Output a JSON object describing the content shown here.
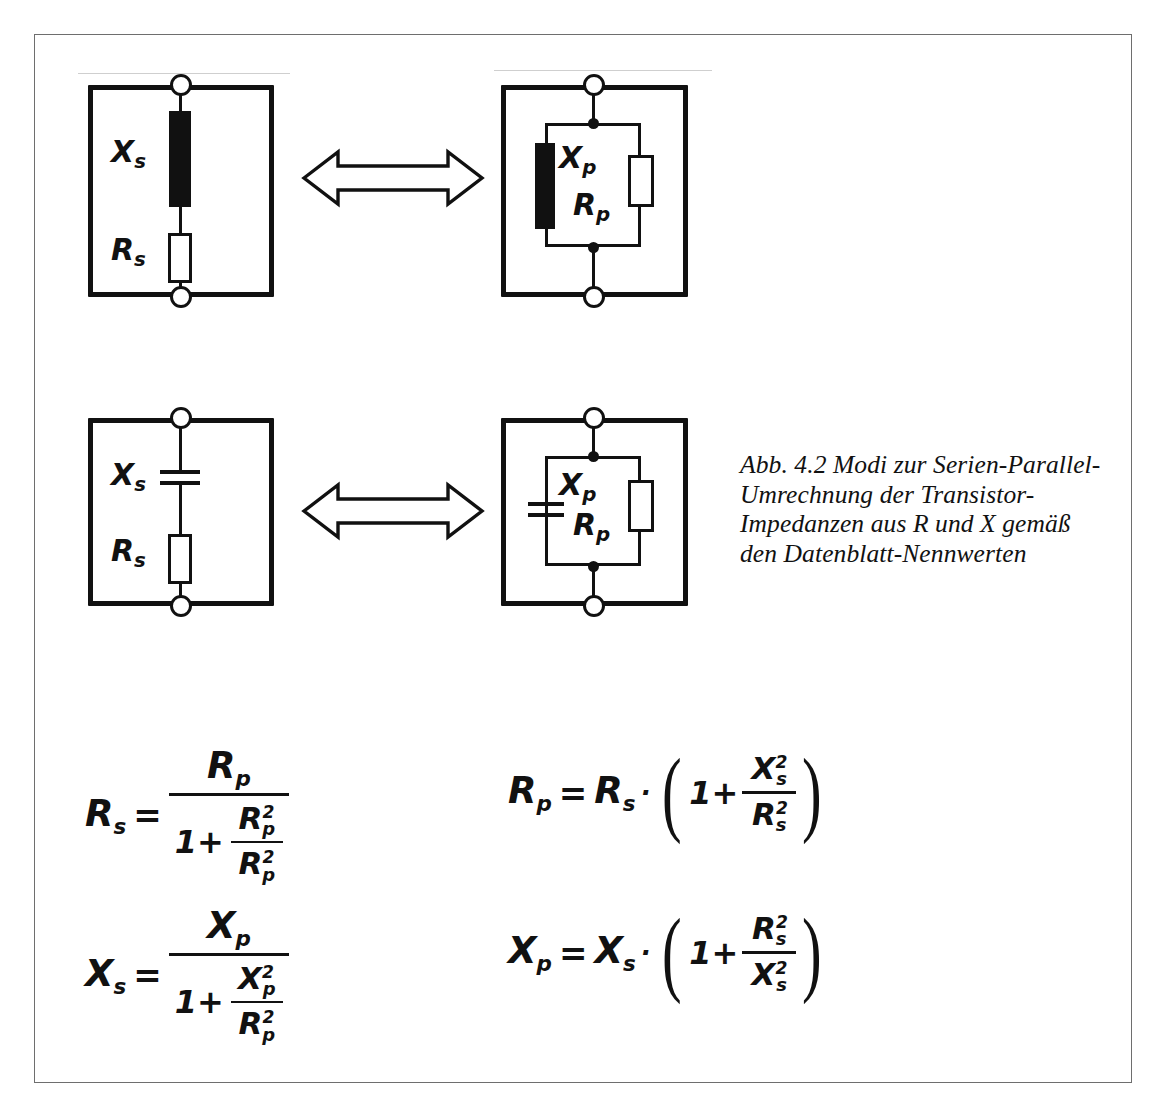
{
  "figure": {
    "caption": {
      "lines": [
        "Abb. 4.2 Modi zur Serien-Parallel-",
        "Umrechnung der Transistor-",
        "Impedanzen aus R und X gemäß",
        "den Datenblatt-Nennwerten"
      ]
    },
    "diagrams": [
      {
        "id": "series-inductive",
        "role": "series equivalent circuit with inductive reactance",
        "labels": [
          {
            "symbol": "X",
            "subscript": "s"
          },
          {
            "symbol": "R",
            "subscript": "s"
          }
        ],
        "components": [
          "inductor-bar",
          "resistor"
        ],
        "terminals": 2
      },
      {
        "id": "parallel-inductive",
        "role": "parallel equivalent circuit with inductive reactance",
        "labels": [
          {
            "symbol": "X",
            "subscript": "p"
          },
          {
            "symbol": "R",
            "subscript": "p"
          }
        ],
        "components": [
          "inductor-bar",
          "resistor"
        ],
        "terminals": 2
      },
      {
        "id": "series-capacitive",
        "role": "series equivalent circuit with capacitive reactance",
        "labels": [
          {
            "symbol": "X",
            "subscript": "s"
          },
          {
            "symbol": "R",
            "subscript": "s"
          }
        ],
        "components": [
          "capacitor",
          "resistor"
        ],
        "terminals": 2
      },
      {
        "id": "parallel-capacitive",
        "role": "parallel equivalent circuit with capacitive reactance",
        "labels": [
          {
            "symbol": "X",
            "subscript": "p"
          },
          {
            "symbol": "R",
            "subscript": "p"
          }
        ],
        "components": [
          "capacitor",
          "resistor"
        ],
        "terminals": 2
      }
    ],
    "arrows": [
      {
        "id": "arrow-row-1",
        "kind": "double-headed-outline-arrow"
      },
      {
        "id": "arrow-row-2",
        "kind": "double-headed-outline-arrow"
      }
    ],
    "formulas": [
      {
        "id": "rs-from-rp",
        "lhs": "R",
        "lhs_sub": "s",
        "equals": "=",
        "numerator": {
          "symbol": "R",
          "sub": "p"
        },
        "denominator": {
          "lead": "1+",
          "frac_num": {
            "symbol": "R",
            "sub": "p",
            "sup": "2"
          },
          "frac_den": {
            "symbol": "R",
            "sub": "p",
            "sup": "2"
          }
        }
      },
      {
        "id": "rp-from-rs",
        "lhs": "R",
        "lhs_sub": "p",
        "equals": "=",
        "factor": {
          "symbol": "R",
          "sub": "s"
        },
        "dot": "·",
        "paren_lead": "1+",
        "frac_num": {
          "symbol": "X",
          "sub": "s",
          "sup": "2"
        },
        "frac_den": {
          "symbol": "R",
          "sub": "s",
          "sup": "2"
        }
      },
      {
        "id": "xs-from-xp",
        "lhs": "X",
        "lhs_sub": "s",
        "equals": "=",
        "numerator": {
          "symbol": "X",
          "sub": "p"
        },
        "denominator": {
          "lead": "1+",
          "frac_num": {
            "symbol": "X",
            "sub": "p",
            "sup": "2"
          },
          "frac_den": {
            "symbol": "R",
            "sub": "p",
            "sup": "2"
          }
        }
      },
      {
        "id": "xp-from-xs",
        "lhs": "X",
        "lhs_sub": "p",
        "equals": "=",
        "factor": {
          "symbol": "X",
          "sub": "s"
        },
        "dot": "·",
        "paren_lead": "1+",
        "frac_num": {
          "symbol": "R",
          "sub": "s",
          "sup": "2"
        },
        "frac_den": {
          "symbol": "X",
          "sub": "s",
          "sup": "2"
        }
      }
    ],
    "colors": {
      "ink": "#111111",
      "frame": "#6e6e6e",
      "paper": "#ffffff"
    }
  }
}
